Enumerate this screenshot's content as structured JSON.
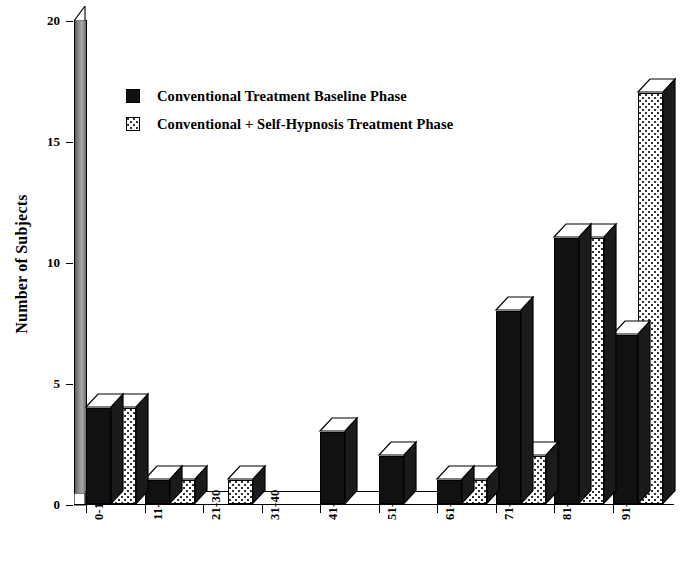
{
  "chart_data": {
    "type": "bar",
    "title": "",
    "xlabel": "",
    "ylabel": "Number of Subjects",
    "categories": [
      "0-10",
      "11-20",
      "21-30",
      "31-40",
      "41-50",
      "51-60",
      "61-70",
      "71-80",
      "81-90",
      "91-100"
    ],
    "series": [
      {
        "name": "Conventional Treatment Baseline Phase",
        "swatch": "solid-black",
        "color": "#111111",
        "values": [
          4,
          1,
          0,
          0,
          3,
          2,
          1,
          8,
          11,
          7
        ]
      },
      {
        "name": "Conventional + Self-Hypnosis Treatment Phase",
        "swatch": "white-dotted",
        "color": "#ffffff",
        "values": [
          4,
          1,
          1,
          0,
          0,
          0,
          1,
          2,
          11,
          17
        ]
      }
    ],
    "ylim": [
      0,
      20
    ],
    "yticks": [
      0,
      5,
      10,
      15,
      20
    ],
    "ytick_labels": [
      "0",
      "5",
      "10",
      "15",
      "20"
    ],
    "grid": false,
    "legend_position": "upper-left-inside",
    "style": "3d-isometric-bars",
    "xtick_label_rotation": -90
  },
  "axis": {
    "y_title": "Number of Subjects"
  },
  "legend": {
    "items": [
      {
        "label": "Conventional Treatment Baseline Phase",
        "swatch": "dark"
      },
      {
        "label": "Conventional + Self-Hypnosis Treatment Phase",
        "swatch": "dotted"
      }
    ]
  }
}
